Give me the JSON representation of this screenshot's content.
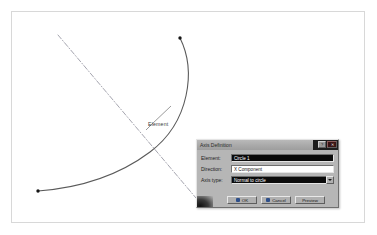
{
  "canvas": {
    "element_label": "Element",
    "geometry": {
      "arc_name": "circle-arc",
      "axis_name": "dash-dot-axis",
      "arc_color": "#555555",
      "axis_color": "#8f8f9a",
      "endpoint_color": "#1a1a1a"
    }
  },
  "dialog": {
    "title": "Axis Definition",
    "titlebar_buttons": {
      "help_label": "?",
      "close_label": "✕"
    },
    "fields": [
      {
        "label": "Element:",
        "value": "Circle 1",
        "type": "text",
        "selected": true
      },
      {
        "label": "Direction:",
        "value": "X Component",
        "type": "text",
        "selected": false
      },
      {
        "label": "Axis type:",
        "value": "Normal to circle",
        "type": "combo",
        "selected": true
      }
    ],
    "buttons": [
      {
        "label": "OK"
      },
      {
        "label": "Cancel"
      },
      {
        "label": "Preview"
      }
    ]
  }
}
